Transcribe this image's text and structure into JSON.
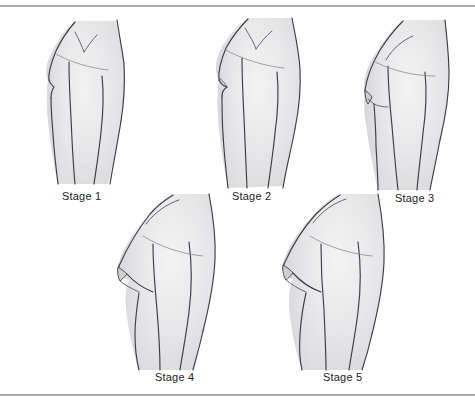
{
  "page": {
    "background_color": "#ffffff",
    "rule_color": "#8e8e8e",
    "ink_color": "#3c3c46",
    "skin_fill_color": "#e6e6e8"
  },
  "figures": [
    {
      "id": "stage-1",
      "label": "Stage 1",
      "row": 1,
      "column": 1,
      "description": "Prepubertal flat chest, elevation of papilla only"
    },
    {
      "id": "stage-2",
      "label": "Stage 2",
      "row": 1,
      "column": 2,
      "description": "Breast bud stage, small mound with areolar enlargement"
    },
    {
      "id": "stage-3",
      "label": "Stage 3",
      "row": 1,
      "column": 3,
      "description": "Further enlargement of breast and areola, no separate contour"
    },
    {
      "id": "stage-4",
      "label": "Stage 4",
      "row": 2,
      "column": 1,
      "description": "Areola and papilla form a secondary mound above breast level"
    },
    {
      "id": "stage-5",
      "label": "Stage 5",
      "row": 2,
      "column": 2,
      "description": "Mature stage, projection of papilla only, areola recessed into breast contour"
    }
  ],
  "labels": {
    "stage_1": "Stage 1",
    "stage_2": "Stage 2",
    "stage_3": "Stage 3",
    "stage_4": "Stage 4",
    "stage_5": "Stage 5"
  }
}
